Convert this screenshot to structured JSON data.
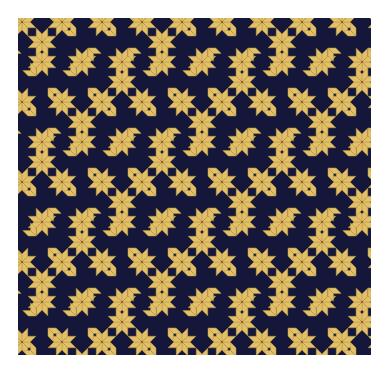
{
  "figure": {
    "colors": {
      "background": "#ffffff",
      "field": "#14173a",
      "tile": "#e2c06a",
      "tile_edge": "#b8963f",
      "center_dot": "#6b5520"
    },
    "bounds": {
      "x": 18,
      "y": 18,
      "width": 353,
      "height": 337
    },
    "star": {
      "radius": 15,
      "rhombus_angle_deg": 45
    },
    "lattice": {
      "spacing_x": 40,
      "spacing_y": 40,
      "origin_x": 4,
      "origin_y": 4
    }
  }
}
